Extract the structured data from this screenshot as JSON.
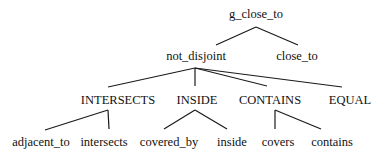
{
  "diagram": {
    "type": "tree",
    "nodes": {
      "root": {
        "label": "g_close_to",
        "x": 256,
        "y": 15
      },
      "not_disjoint": {
        "label": "not_disjoint",
        "x": 196,
        "y": 57
      },
      "close_to": {
        "label": "close_to",
        "x": 297,
        "y": 57
      },
      "intersects_u": {
        "label": "INTERSECTS",
        "x": 118,
        "y": 101
      },
      "inside_u": {
        "label": "INSIDE",
        "x": 197,
        "y": 101
      },
      "contains_u": {
        "label": "CONTAINS",
        "x": 270,
        "y": 101
      },
      "equal_u": {
        "label": "EQUAL",
        "x": 350,
        "y": 101
      },
      "adjacent_to": {
        "label": "adjacent_to",
        "x": 41,
        "y": 143
      },
      "intersects": {
        "label": "intersects",
        "x": 104,
        "y": 143
      },
      "covered_by": {
        "label": "covered_by",
        "x": 169,
        "y": 143
      },
      "inside": {
        "label": "inside",
        "x": 232,
        "y": 143
      },
      "covers": {
        "label": "covers",
        "x": 278,
        "y": 143
      },
      "contains": {
        "label": "contains",
        "x": 332,
        "y": 143
      }
    },
    "edges": [
      {
        "from": "root",
        "to": "not_disjoint",
        "x1": 256,
        "y1": 27,
        "x2": 216,
        "y2": 45
      },
      {
        "from": "root",
        "to": "close_to",
        "x1": 256,
        "y1": 27,
        "x2": 298,
        "y2": 45
      },
      {
        "from": "not_disjoint",
        "to": "intersects_u",
        "x1": 195,
        "y1": 68,
        "x2": 108,
        "y2": 87
      },
      {
        "from": "not_disjoint",
        "to": "inside_u",
        "x1": 195,
        "y1": 68,
        "x2": 195,
        "y2": 86
      },
      {
        "from": "not_disjoint",
        "to": "contains_u",
        "x1": 195,
        "y1": 68,
        "x2": 267,
        "y2": 86
      },
      {
        "from": "not_disjoint",
        "to": "equal_u",
        "x1": 195,
        "y1": 68,
        "x2": 342,
        "y2": 87
      },
      {
        "from": "intersects_u",
        "to": "adjacent_to",
        "x1": 108,
        "y1": 110,
        "x2": 45,
        "y2": 130
      },
      {
        "from": "intersects_u",
        "to": "intersects",
        "x1": 108,
        "y1": 110,
        "x2": 109,
        "y2": 129
      },
      {
        "from": "inside_u",
        "to": "covered_by",
        "x1": 195,
        "y1": 110,
        "x2": 164,
        "y2": 129
      },
      {
        "from": "inside_u",
        "to": "inside",
        "x1": 195,
        "y1": 110,
        "x2": 227,
        "y2": 129
      },
      {
        "from": "contains_u",
        "to": "covers",
        "x1": 275,
        "y1": 110,
        "x2": 275,
        "y2": 129
      },
      {
        "from": "contains_u",
        "to": "contains",
        "x1": 275,
        "y1": 110,
        "x2": 321,
        "y2": 129
      }
    ]
  }
}
